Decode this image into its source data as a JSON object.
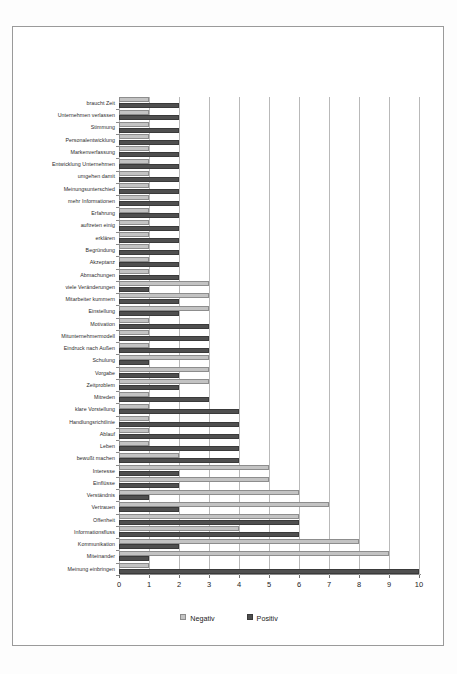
{
  "chart_data": {
    "type": "bar",
    "orientation": "horizontal",
    "title": "",
    "subtitle": "",
    "xlabel": "",
    "ylabel": "",
    "xlim": [
      0,
      10
    ],
    "xticks": [
      0,
      1,
      2,
      3,
      4,
      5,
      6,
      7,
      8,
      9,
      10
    ],
    "grid": true,
    "legend_position": "bottom",
    "colors": {
      "negativ": "#c3c3c3",
      "positiv": "#4f4f4f"
    },
    "categories": [
      "braucht Zeit",
      "Unternehmen verlassen",
      "Stimmung",
      "Personalentwicklung",
      "Markenverfassung",
      "Entwicklung Unternehmen",
      "umgehen damit",
      "Meinungsunterschied",
      "mehr Informationen",
      "Erfahrung",
      "auftreten einig",
      "erklären",
      "Begründung",
      "Akzeptanz",
      "Abmachungen",
      "viele Veränderungen",
      "Mitarbeiter kummern",
      "Einstellung",
      "Motivation",
      "Mitunternehmermodell",
      "Eindruck nach Außen",
      "Schulung",
      "Vorgabe",
      "Zeitproblem",
      "Mitreden",
      "klare Vorstellung",
      "Handlungsrichtlinie",
      "Ablauf",
      "Leben",
      "bewußt machen",
      "Interesse",
      "Einflüsse",
      "Verständnis",
      "Vertrauen",
      "Offenheit",
      "Informationsfluss",
      "Kommunikation",
      "Miteinander",
      "Meinung einbringen"
    ],
    "series": [
      {
        "name": "Negativ",
        "values": [
          1,
          1,
          1,
          1,
          1,
          1,
          1,
          1,
          1,
          1,
          1,
          1,
          1,
          1,
          1,
          3,
          3,
          3,
          1,
          1,
          1,
          3,
          3,
          3,
          1,
          1,
          1,
          1,
          1,
          2,
          5,
          5,
          6,
          7,
          6,
          4,
          8,
          9,
          1
        ]
      },
      {
        "name": "Positiv",
        "values": [
          2,
          2,
          2,
          2,
          2,
          2,
          2,
          2,
          2,
          2,
          2,
          2,
          2,
          2,
          2,
          1,
          2,
          2,
          3,
          3,
          3,
          1,
          2,
          2,
          3,
          4,
          4,
          4,
          4,
          4,
          2,
          2,
          1,
          2,
          6,
          6,
          2,
          1,
          10
        ]
      }
    ]
  },
  "legend": {
    "items": [
      {
        "label": "Negativ",
        "color": "#c3c3c3"
      },
      {
        "label": "Positiv",
        "color": "#4f4f4f"
      }
    ]
  },
  "axis": {
    "tick_labels": [
      "0",
      "1",
      "2",
      "3",
      "4",
      "5",
      "6",
      "7",
      "8",
      "9",
      "10"
    ]
  }
}
